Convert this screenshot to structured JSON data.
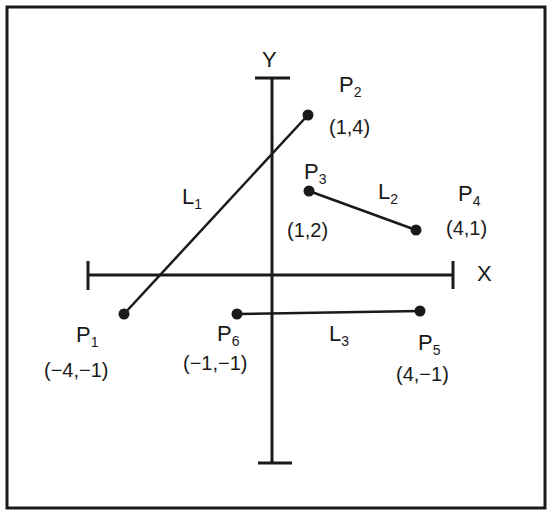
{
  "figure": {
    "type": "coordinate-plane-line-segments",
    "axes": {
      "x_label": "X",
      "y_label": "Y"
    },
    "colors": {
      "ink": "#1a1a1a",
      "background": "#ffffff"
    }
  },
  "points": [
    {
      "name": "P",
      "sub": "1",
      "coord": "(−4,−1)",
      "x": -4,
      "y": -1
    },
    {
      "name": "P",
      "sub": "2",
      "coord": "(1,4)",
      "x": 1,
      "y": 4
    },
    {
      "name": "P",
      "sub": "3",
      "coord": "(1,2)",
      "x": 1,
      "y": 2
    },
    {
      "name": "P",
      "sub": "4",
      "coord": "(4,1)",
      "x": 4,
      "y": 1
    },
    {
      "name": "P",
      "sub": "5",
      "coord": "(4,−1)",
      "x": 4,
      "y": -1
    },
    {
      "name": "P",
      "sub": "6",
      "coord": "(−1,−1)",
      "x": -1,
      "y": -1
    }
  ],
  "lines": [
    {
      "name": "L",
      "sub": "1",
      "from": "P1",
      "to": "P2"
    },
    {
      "name": "L",
      "sub": "2",
      "from": "P3",
      "to": "P4"
    },
    {
      "name": "L",
      "sub": "3",
      "from": "P6",
      "to": "P5"
    }
  ]
}
